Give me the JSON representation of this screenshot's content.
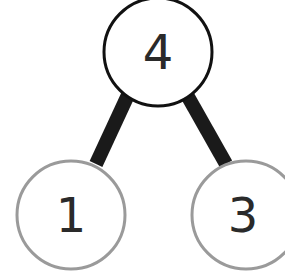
{
  "diagram": {
    "type": "number-bond",
    "whole": {
      "label": "4",
      "cx": 158,
      "cy": 52,
      "r": 54,
      "stroke": "#111111"
    },
    "parts": [
      {
        "label": "1",
        "cx": 71,
        "cy": 215,
        "r": 54,
        "stroke": "#999999"
      },
      {
        "label": "3",
        "cx": 246,
        "cy": 215,
        "r": 54,
        "stroke": "#999999"
      }
    ],
    "connector_color": "#1a1a1a",
    "background": "#ffffff"
  }
}
